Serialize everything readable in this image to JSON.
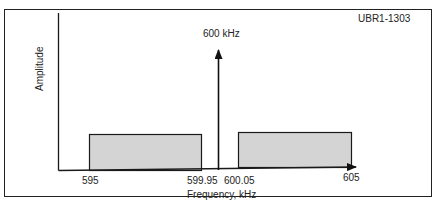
{
  "figure_id": "UBR1-1303",
  "carrier": {
    "label": "600 kHz",
    "frequency_khz": 600
  },
  "axes": {
    "ylabel": "Amplitude",
    "xlabel": "Frequency, kHz"
  },
  "ticks": {
    "t595": "595",
    "t59995": "599.95",
    "t60005": "600.05",
    "t605": "605"
  },
  "sidebands": [
    {
      "name": "lower sideband",
      "start_khz": 595,
      "end_khz": 599.95
    },
    {
      "name": "upper sideband",
      "start_khz": 600.05,
      "end_khz": 605
    }
  ],
  "colors": {
    "sideband_fill": "#d4d4d4",
    "stroke": "#1a1a1a"
  }
}
